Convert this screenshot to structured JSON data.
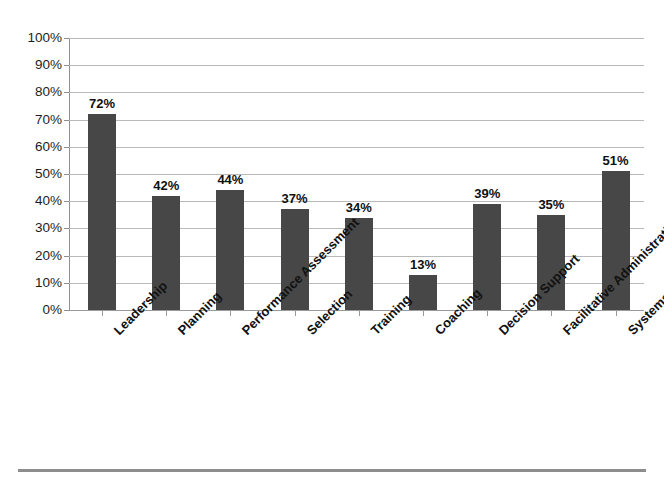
{
  "chart_data": {
    "type": "bar",
    "title": "",
    "subtitle": "",
    "xlabel": "",
    "ylabel": "",
    "categories": [
      "Leadership",
      "Planning",
      "Performance Assessment",
      "Selection",
      "Training",
      "Coaching",
      "Decision Support",
      "Facilitative Administration",
      "Systems Intervention"
    ],
    "values": [
      72,
      42,
      44,
      37,
      34,
      13,
      39,
      35,
      51
    ],
    "value_labels": [
      "72%",
      "42%",
      "44%",
      "37%",
      "34%",
      "13%",
      "39%",
      "35%",
      "51%"
    ],
    "ylim": [
      0,
      100
    ],
    "ytick_values": [
      0,
      10,
      20,
      30,
      40,
      50,
      60,
      70,
      80,
      90,
      100
    ],
    "ytick_labels": [
      "0%",
      "10%",
      "20%",
      "30%",
      "40%",
      "50%",
      "60%",
      "70%",
      "80%",
      "90%",
      "100%"
    ],
    "grid": true,
    "legend": false,
    "legend_position": "none",
    "series": [
      {
        "name": "Percent",
        "values": [
          72,
          42,
          44,
          37,
          34,
          13,
          39,
          35,
          51
        ]
      }
    ],
    "colors": {
      "bar": "#474747",
      "gridline": "#b9b9b9",
      "axis": "#8f8f8f",
      "text": "#111111",
      "background": "#ffffff",
      "rule": "#8d8d8d"
    }
  }
}
